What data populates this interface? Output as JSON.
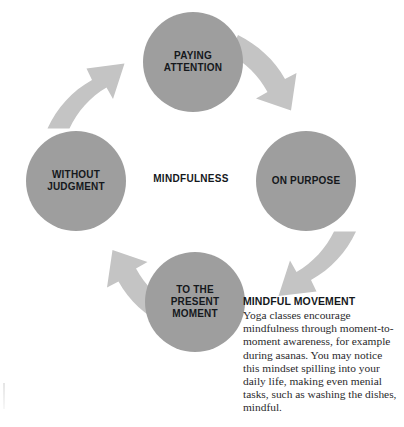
{
  "diagram": {
    "type": "cycle",
    "hub_label": "MINDFULNESS",
    "colors": {
      "node_fill": "#9e9e9e",
      "arrow_fill": "#c4c4c4",
      "text": "#15181c",
      "background": "#ffffff"
    },
    "nodes": [
      {
        "id": "paying-attention",
        "label": "PAYING\nATTENTION",
        "position": "top",
        "cx": 193,
        "cy": 62,
        "r": 50
      },
      {
        "id": "on-purpose",
        "label": "ON PURPOSE",
        "position": "right",
        "cx": 306,
        "cy": 181,
        "r": 50
      },
      {
        "id": "to-the-present-moment",
        "label": "TO THE\nPRESENT\nMOMENT",
        "position": "bottom",
        "cx": 195,
        "cy": 302,
        "r": 50
      },
      {
        "id": "without-judgment",
        "label": "WITHOUT\nJUDGMENT",
        "position": "left",
        "cx": 76,
        "cy": 181,
        "r": 50
      }
    ],
    "arrows": [
      {
        "id": "arrow-top-to-right",
        "from": "paying-attention",
        "to": "on-purpose",
        "direction": "clockwise"
      },
      {
        "id": "arrow-right-to-bottom",
        "from": "on-purpose",
        "to": "to-the-present-moment",
        "direction": "clockwise"
      },
      {
        "id": "arrow-bottom-to-left",
        "from": "to-the-present-moment",
        "to": "without-judgment",
        "direction": "clockwise"
      },
      {
        "id": "arrow-left-to-top",
        "from": "without-judgment",
        "to": "paying-attention",
        "direction": "clockwise"
      }
    ]
  },
  "caption": {
    "heading": "MINDFUL MOVEMENT",
    "body": "Yoga classes encourage mindfulness through moment-to-moment awareness, for example during asanas. You may notice this mindset spilling into your daily life, making even menial tasks, such as washing the dishes, mindful."
  }
}
